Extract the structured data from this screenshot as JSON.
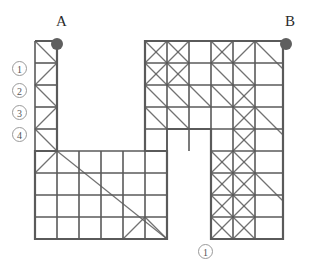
{
  "figure": {
    "type": "grid-polygon-diagram",
    "background": "#ffffff",
    "line_color": "#5a5a5a",
    "node_color": "#5f5f5f",
    "label_color": "#2b2b2b",
    "circle_label_color": "#555555",
    "cell_size": 22,
    "origin": {
      "x": 35,
      "y": 41
    }
  },
  "endpoints": [
    {
      "id": "A",
      "label": "A",
      "label_x": 56,
      "label_y": 14,
      "dot_x": 57,
      "dot_y": 44,
      "dot_r": 6
    },
    {
      "id": "B",
      "label": "B",
      "label_x": 285,
      "label_y": 14,
      "dot_x": 286,
      "dot_y": 44,
      "dot_r": 6
    }
  ],
  "edge_labels": [
    {
      "text": "1",
      "x": 12,
      "y": 61
    },
    {
      "text": "2",
      "x": 12,
      "y": 83
    },
    {
      "text": "3",
      "x": 12,
      "y": 105
    },
    {
      "text": "4",
      "x": 12,
      "y": 127
    },
    {
      "text": "1",
      "x": 198,
      "y": 244
    }
  ],
  "outline": "M35,41 L57,41 L57,151 L35,151 L35,239 L167,239 L167,151 L145,151 L145,41 L283,41 L283,239 L211,239 L211,129 L167,129",
  "chart_data": {
    "type": "diagram",
    "title": "",
    "grid_columns": 12,
    "grid_rows": 9,
    "cell_px": 22
  },
  "geometry": {
    "segments_h": [
      [
        35,
        41,
        57,
        41
      ],
      [
        145,
        41,
        283,
        41
      ],
      [
        35,
        63,
        57,
        63
      ],
      [
        145,
        63,
        283,
        63
      ],
      [
        35,
        85,
        57,
        85
      ],
      [
        145,
        85,
        283,
        85
      ],
      [
        35,
        107,
        57,
        107
      ],
      [
        145,
        107,
        283,
        107
      ],
      [
        35,
        129,
        57,
        129
      ],
      [
        145,
        129,
        283,
        129
      ],
      [
        35,
        151,
        167,
        151
      ],
      [
        211,
        151,
        283,
        151
      ],
      [
        35,
        173,
        167,
        173
      ],
      [
        211,
        173,
        283,
        173
      ],
      [
        35,
        195,
        167,
        195
      ],
      [
        211,
        195,
        283,
        195
      ],
      [
        35,
        217,
        167,
        217
      ],
      [
        211,
        217,
        283,
        217
      ],
      [
        35,
        239,
        167,
        239
      ],
      [
        211,
        239,
        283,
        239
      ]
    ],
    "segments_v": [
      [
        35,
        41,
        35,
        239
      ],
      [
        57,
        41,
        57,
        239
      ],
      [
        79,
        151,
        79,
        239
      ],
      [
        101,
        151,
        101,
        239
      ],
      [
        123,
        151,
        123,
        239
      ],
      [
        145,
        151,
        145,
        239
      ],
      [
        167,
        129,
        167,
        239
      ],
      [
        145,
        41,
        145,
        151
      ],
      [
        167,
        41,
        167,
        151
      ],
      [
        189,
        41,
        189,
        151
      ],
      [
        211,
        41,
        211,
        239
      ],
      [
        233,
        41,
        233,
        239
      ],
      [
        255,
        41,
        255,
        239
      ],
      [
        283,
        41,
        283,
        239
      ]
    ],
    "segments_d": [
      [
        35,
        41,
        57,
        63
      ],
      [
        57,
        63,
        35,
        85
      ],
      [
        35,
        85,
        57,
        107
      ],
      [
        57,
        107,
        35,
        129
      ],
      [
        35,
        129,
        57,
        151
      ],
      [
        57,
        151,
        35,
        173
      ],
      [
        57,
        151,
        167,
        239
      ],
      [
        145,
        217,
        167,
        239
      ],
      [
        123,
        239,
        145,
        217
      ],
      [
        145,
        41,
        167,
        63
      ],
      [
        167,
        41,
        145,
        63
      ],
      [
        167,
        41,
        189,
        63
      ],
      [
        189,
        41,
        167,
        63
      ],
      [
        145,
        63,
        167,
        85
      ],
      [
        167,
        63,
        145,
        85
      ],
      [
        167,
        63,
        189,
        85
      ],
      [
        189,
        63,
        167,
        85
      ],
      [
        145,
        85,
        167,
        107
      ],
      [
        145,
        107,
        167,
        129
      ],
      [
        167,
        85,
        189,
        107
      ],
      [
        167,
        107,
        189,
        129
      ],
      [
        189,
        85,
        211,
        107
      ],
      [
        211,
        41,
        233,
        63
      ],
      [
        233,
        41,
        211,
        63
      ],
      [
        255,
        41,
        233,
        63
      ],
      [
        233,
        63,
        255,
        85
      ],
      [
        211,
        63,
        233,
        85
      ],
      [
        211,
        85,
        233,
        107
      ],
      [
        233,
        85,
        255,
        107
      ],
      [
        255,
        85,
        233,
        107
      ],
      [
        233,
        107,
        255,
        129
      ],
      [
        255,
        107,
        233,
        129
      ],
      [
        255,
        129,
        233,
        151
      ],
      [
        233,
        129,
        255,
        151
      ],
      [
        211,
        151,
        233,
        173
      ],
      [
        233,
        151,
        211,
        173
      ],
      [
        233,
        151,
        255,
        173
      ],
      [
        255,
        151,
        233,
        173
      ],
      [
        211,
        173,
        233,
        195
      ],
      [
        233,
        173,
        211,
        195
      ],
      [
        233,
        173,
        255,
        195
      ],
      [
        255,
        173,
        233,
        195
      ],
      [
        211,
        195,
        233,
        217
      ],
      [
        233,
        195,
        211,
        217
      ],
      [
        233,
        195,
        255,
        217
      ],
      [
        255,
        195,
        233,
        217
      ],
      [
        211,
        217,
        233,
        239
      ],
      [
        233,
        217,
        211,
        239
      ],
      [
        233,
        217,
        255,
        239
      ],
      [
        255,
        217,
        233,
        239
      ],
      [
        255,
        41,
        283,
        69
      ],
      [
        255,
        107,
        283,
        135
      ],
      [
        255,
        173,
        283,
        201
      ]
    ]
  }
}
